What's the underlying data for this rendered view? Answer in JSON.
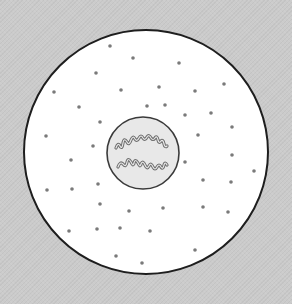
{
  "diagram": {
    "colors": {
      "background": "#cbcbcb",
      "cytoplasm": "#ffffff",
      "membrane": "#1e1e1e",
      "nucleus_fill": "#e6e6e6",
      "nuclear_membrane": "#3a3a3a",
      "granule": "#7a7a7a",
      "chromosome_stroke": "#6e6e6e"
    },
    "cell": {
      "cx": 146,
      "cy": 152,
      "r": 122
    },
    "nucleus": {
      "cx": 143,
      "cy": 153,
      "r": 36
    },
    "granules": [
      [
        110,
        46
      ],
      [
        133,
        58
      ],
      [
        179,
        63
      ],
      [
        96,
        73
      ],
      [
        54,
        92
      ],
      [
        121,
        90
      ],
      [
        159,
        87
      ],
      [
        195,
        91
      ],
      [
        224,
        84
      ],
      [
        79,
        107
      ],
      [
        147,
        106
      ],
      [
        165,
        105
      ],
      [
        185,
        115
      ],
      [
        211,
        113
      ],
      [
        100,
        122
      ],
      [
        46,
        136
      ],
      [
        232,
        127
      ],
      [
        93,
        146
      ],
      [
        198,
        135
      ],
      [
        232,
        155
      ],
      [
        71,
        160
      ],
      [
        185,
        162
      ],
      [
        254,
        171
      ],
      [
        203,
        180
      ],
      [
        98,
        184
      ],
      [
        47,
        190
      ],
      [
        72,
        189
      ],
      [
        231,
        182
      ],
      [
        100,
        204
      ],
      [
        129,
        211
      ],
      [
        163,
        208
      ],
      [
        203,
        207
      ],
      [
        228,
        212
      ],
      [
        69,
        231
      ],
      [
        97,
        229
      ],
      [
        120,
        228
      ],
      [
        150,
        231
      ],
      [
        195,
        250
      ],
      [
        116,
        256
      ],
      [
        142,
        263
      ]
    ]
  }
}
